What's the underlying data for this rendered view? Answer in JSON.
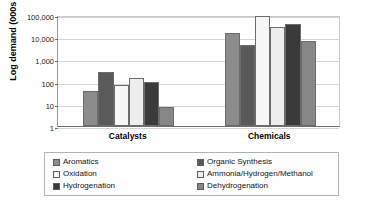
{
  "chart_data": {
    "type": "bar",
    "title": "",
    "subtitle": "",
    "xlabel": "",
    "ylabel": "Log demand (000s mt)",
    "y_scale": "log",
    "ylim": [
      1,
      100000
    ],
    "y_ticks": [
      "1",
      "10",
      "100",
      "1,000",
      "10,000",
      "100,000"
    ],
    "y_tick_values": [
      1,
      10,
      100,
      1000,
      10000,
      100000
    ],
    "grid": true,
    "legend_position": "bottom",
    "categories": [
      "Catalysts",
      "Chemicals"
    ],
    "series": [
      {
        "name": "Aromatics",
        "color": "#8c8c8c",
        "values": [
          38,
          15000
        ]
      },
      {
        "name": "Organic Synthesis",
        "color": "#595959",
        "values": [
          280,
          4500
        ]
      },
      {
        "name": "Oxidation",
        "color": "#f7f7f7",
        "values": [
          68,
          95000
        ]
      },
      {
        "name": "Ammonia/Hydrogen/Methanol",
        "color": "#ededed",
        "values": [
          145,
          28000
        ]
      },
      {
        "name": "Hydrogenation",
        "color": "#3a3a3a",
        "values": [
          100,
          41000
        ]
      },
      {
        "name": "Dehydrogenation",
        "color": "#878787",
        "values": [
          7,
          6800
        ]
      }
    ]
  },
  "legend": {
    "left_items": [
      {
        "label": "Aromatics",
        "color": "#8c8c8c"
      },
      {
        "label": "Oxidation",
        "color": "#f7f7f7"
      },
      {
        "label": "Hydrogenation",
        "color": "#3a3a3a"
      }
    ],
    "right_items": [
      {
        "label": "Organic Synthesis",
        "color": "#595959"
      },
      {
        "label": "Ammonia/Hydrogen/Methanol",
        "color": "#ededed"
      },
      {
        "label": "Dehydrogenation",
        "color": "#878787"
      }
    ]
  }
}
